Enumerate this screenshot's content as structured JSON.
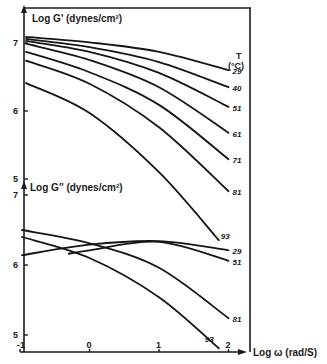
{
  "chart_data": [
    {
      "type": "line",
      "title": "",
      "ylabel": "Log G' (dynes/cm²)",
      "xlabel": "Log ω (rad/S)",
      "legend_title": "T (°C)",
      "xlim": [
        -1,
        2
      ],
      "ylim": [
        4.5,
        7.5
      ],
      "yticks": [
        "7",
        "6",
        "5"
      ],
      "ytick_values": [
        7,
        6,
        5
      ],
      "grid": false,
      "series": [
        {
          "name": "29",
          "x": [
            -1,
            0,
            1,
            2
          ],
          "y": [
            7.09,
            7.01,
            6.87,
            6.6
          ]
        },
        {
          "name": "40",
          "x": [
            -1,
            0,
            1,
            2
          ],
          "y": [
            7.06,
            6.94,
            6.72,
            6.35
          ]
        },
        {
          "name": "51",
          "x": [
            -1,
            0,
            1,
            2
          ],
          "y": [
            7.03,
            6.87,
            6.56,
            6.06
          ]
        },
        {
          "name": "61",
          "x": [
            -1,
            0,
            1,
            2
          ],
          "y": [
            6.99,
            6.75,
            6.35,
            5.68
          ]
        },
        {
          "name": "71",
          "x": [
            -1,
            0,
            1,
            2
          ],
          "y": [
            6.87,
            6.57,
            6.09,
            5.29
          ]
        },
        {
          "name": "81",
          "x": [
            -1,
            0,
            1,
            2
          ],
          "y": [
            6.74,
            6.4,
            5.76,
            4.82
          ]
        },
        {
          "name": "93",
          "x": [
            -1,
            0,
            1,
            1.86
          ],
          "y": [
            6.41,
            5.97,
            5.1,
            4.1
          ]
        }
      ]
    },
    {
      "type": "line",
      "title": "",
      "ylabel": "Log G'' (dynes/cm²)",
      "xlabel": "Log ω (rad/S)",
      "xlim": [
        -1,
        2
      ],
      "xticks": [
        "-1",
        "0",
        "1",
        "2"
      ],
      "xtick_values": [
        -1,
        0,
        1,
        2
      ],
      "ylim": [
        4.8,
        7
      ],
      "yticks": [
        "7",
        "6",
        "5"
      ],
      "ytick_values": [
        7,
        6,
        5
      ],
      "grid": false,
      "series": [
        {
          "name": "29",
          "x": [
            -1,
            0,
            1,
            2
          ],
          "y": [
            6.14,
            6.29,
            6.34,
            6.21
          ]
        },
        {
          "name": "51",
          "x": [
            -0.3,
            0,
            1,
            2
          ],
          "y": [
            6.16,
            6.21,
            6.33,
            6.06
          ]
        },
        {
          "name": "81",
          "x": [
            -1,
            0,
            1,
            2
          ],
          "y": [
            6.5,
            6.31,
            5.96,
            5.24
          ]
        },
        {
          "name": "93",
          "x": [
            -1,
            0,
            1,
            1.86
          ],
          "y": [
            6.4,
            6.1,
            5.54,
            4.81
          ]
        }
      ]
    }
  ]
}
